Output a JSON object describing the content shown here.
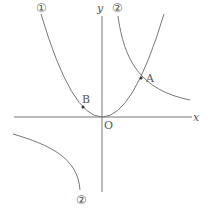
{
  "diagram": {
    "axis_x_label": "x",
    "axis_y_label": "y",
    "origin_label": "O",
    "point_a_label": "A",
    "point_b_label": "B",
    "curve1_label": "①",
    "curve2_label": "②",
    "curve2_lower_label": "②",
    "colors": {
      "line": "#666666",
      "text": "#555555"
    }
  }
}
